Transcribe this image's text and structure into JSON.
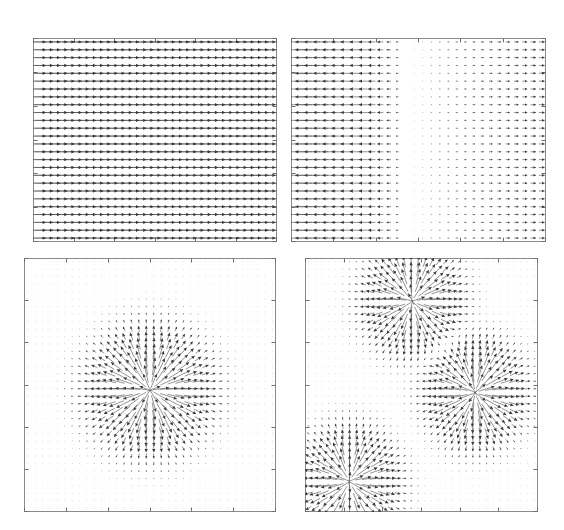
{
  "figure": {
    "title": "",
    "background_color": "#ffffff",
    "width": 564,
    "height": 530,
    "panel_count": 4,
    "arrow_color": "#3a3a3a",
    "frame_color": "#8a8a8a"
  },
  "chart_data": [
    {
      "type": "quiver",
      "panel_id": "top-left",
      "title": "",
      "xlabel": "",
      "ylabel": "",
      "xlim": [
        0,
        1
      ],
      "ylim": [
        0,
        1
      ],
      "grid": false,
      "axis_ticks_labeled": false,
      "tick_count_x": 6,
      "tick_count_y": 6,
      "nx": 34,
      "ny": 26,
      "field": "uniform",
      "description": "Uniform vector field: every arrow points to the right with equal magnitude.",
      "uniform_vector": {
        "u": 1.0,
        "v": 0.0
      },
      "scale": 1.0,
      "sources": []
    },
    {
      "type": "quiver",
      "panel_id": "top-right",
      "title": "",
      "xlabel": "",
      "ylabel": "",
      "xlim": [
        0,
        1
      ],
      "ylim": [
        0,
        1
      ],
      "grid": false,
      "axis_ticks_labeled": false,
      "tick_count_x": 6,
      "tick_count_y": 6,
      "nx": 30,
      "ny": 26,
      "field": "horizontal-divergence",
      "description": "Horizontal divergence field: strong leftward arrows on the left edge decaying to zero near x=0.45, then small rightward arrows toward the right edge.",
      "zero_crossing_x": 0.45,
      "left_magnitude": 1.0,
      "right_magnitude": 0.32,
      "sources": []
    },
    {
      "type": "quiver",
      "panel_id": "bottom-left",
      "title": "",
      "xlabel": "",
      "ylabel": "",
      "xlim": [
        0,
        1
      ],
      "ylim": [
        0,
        1
      ],
      "grid": false,
      "axis_ticks_labeled": false,
      "tick_count_x": 6,
      "tick_count_y": 6,
      "nx": 34,
      "ny": 34,
      "field": "radial-source",
      "description": "Single radial source: arrows point outward from a point near the center, magnitude peaks in a ring around the center and decays to zero far away.",
      "sources": [
        {
          "cx": 0.5,
          "cy": 0.52,
          "strength": 1.0,
          "radius": 0.16
        }
      ]
    },
    {
      "type": "quiver",
      "panel_id": "bottom-right",
      "title": "",
      "xlabel": "",
      "ylabel": "",
      "xlim": [
        0,
        1
      ],
      "ylim": [
        0,
        1
      ],
      "grid": false,
      "axis_ticks_labeled": false,
      "tick_count_x": 6,
      "tick_count_y": 6,
      "nx": 34,
      "ny": 34,
      "field": "multi-radial-source",
      "description": "Three radial sources: one upper-center, one center-right, one lower-left. Arrows point outward from each center.",
      "sources": [
        {
          "cx": 0.46,
          "cy": 0.17,
          "strength": 1.0,
          "radius": 0.14
        },
        {
          "cx": 0.73,
          "cy": 0.53,
          "strength": 1.05,
          "radius": 0.14
        },
        {
          "cx": 0.19,
          "cy": 0.88,
          "strength": 1.0,
          "radius": 0.14
        }
      ]
    }
  ],
  "panels": [
    {
      "name": "top-left",
      "x": 33,
      "y": 38,
      "w": 244,
      "h": 204
    },
    {
      "name": "top-right",
      "x": 291,
      "y": 38,
      "w": 255,
      "h": 204
    },
    {
      "name": "bottom-left",
      "x": 24,
      "y": 258,
      "w": 252,
      "h": 254
    },
    {
      "name": "bottom-right",
      "x": 305,
      "y": 258,
      "w": 233,
      "h": 254
    }
  ]
}
